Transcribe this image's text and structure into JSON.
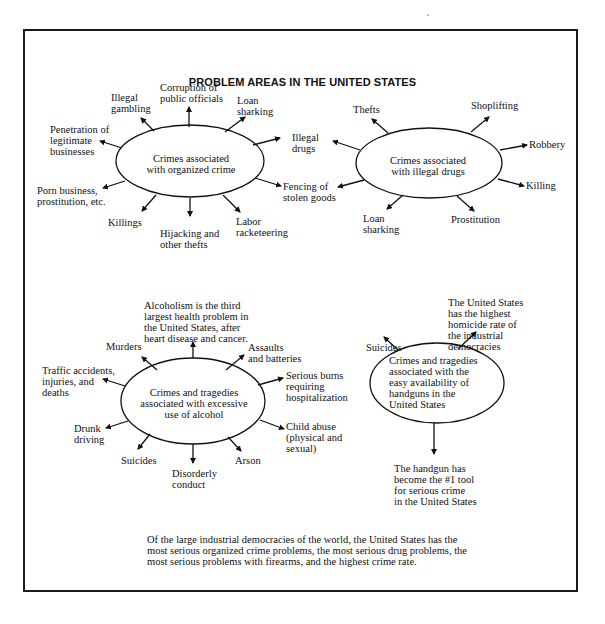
{
  "title": "PROBLEM AREAS IN THE UNITED STATES",
  "clusters": {
    "organized_crime": {
      "center": "Crimes associated\nwith organized crime",
      "items": [
        "Corruption of\npublic officials",
        "Illegal\ngambling",
        "Loan\nsharking",
        "Penetration of\nlegitimate\nbusinesses",
        "Illegal\ndrugs",
        "Porn business,\nprostitution, etc.",
        "Fencing of\nstolen goods",
        "Killings",
        "Hijacking and\nother thefts",
        "Labor\nracketeering"
      ]
    },
    "illegal_drugs": {
      "center": "Crimes associated\nwith illegal drugs",
      "items": [
        "Thefts",
        "Shoplifting",
        "Robbery",
        "Killing",
        "Prostitution",
        "Loan\nsharking"
      ]
    },
    "alcohol": {
      "center": "Crimes and tragedies\nassociated with excessive\nuse of alcohol",
      "items": [
        "Alcoholism is the third\nlargest health problem in\nthe United States, after\nheart disease and cancer.",
        "Murders",
        "Assaults\nand batteries",
        "Traffic accidents,\ninjuries, and\ndeaths",
        "Serious burns\nrequiring\nhospitalization",
        "Drunk\ndriving",
        "Child abuse\n(physical and\nsexual)",
        "Suicides",
        "Disorderly\nconduct",
        "Arson"
      ]
    },
    "handguns": {
      "center": "Crimes and tragedies\nassociated with the\neasy availability of\nhandguns in the\nUnited States",
      "items": [
        "Suicides",
        "The United States\nhas the highest\nhomicide rate of\nthe industrial\ndemocracies",
        "The handgun has\nbecome the #1 tool\nfor serious crime\nin the United States"
      ]
    }
  },
  "footnote": "Of the large industrial democracies of the world, the United States has the most serious organized crime problems, the most serious drug problems, the most serious problems with firearms, and the highest crime rate.",
  "colors": {
    "ink": "#111111",
    "background": "#ffffff"
  }
}
